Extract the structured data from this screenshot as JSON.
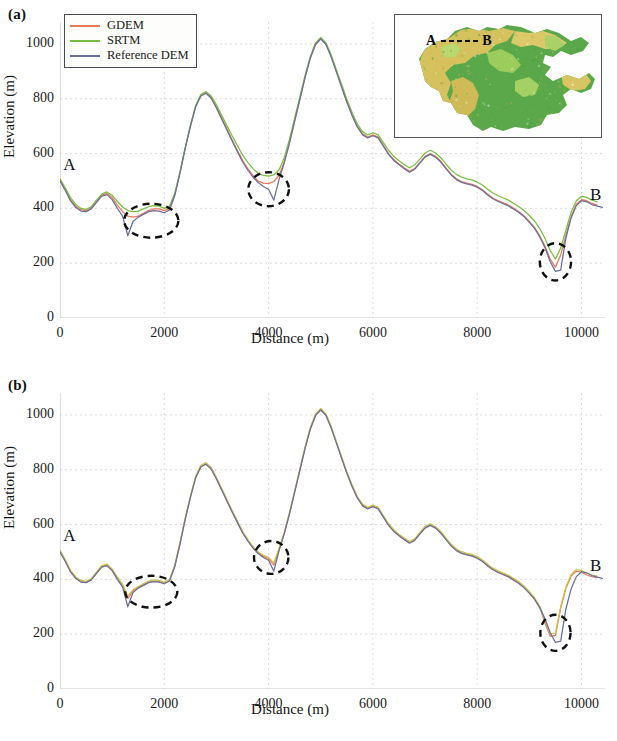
{
  "figure": {
    "panels": [
      {
        "id": "a",
        "label": "(a)",
        "legend": [
          {
            "name": "GDEM",
            "color": "#e8795a"
          },
          {
            "name": "SRTM",
            "color": "#79c040"
          },
          {
            "name": "Reference DEM",
            "color": "#6b6f9e"
          }
        ],
        "start_label": "A",
        "end_label": "B"
      },
      {
        "id": "b",
        "label": "(b)",
        "legend": [
          {
            "name": "GDEM after shifting",
            "color": "#e8795a"
          },
          {
            "name": "SRTM after re-interpolation",
            "color": "#79c040"
          },
          {
            "name": "Reference DEM",
            "color": "#6b6f9e"
          }
        ],
        "start_label": "A",
        "end_label": "B"
      }
    ],
    "inset": {
      "transect_start_label": "A",
      "transect_end_label": "B",
      "description": "shaded-relief terrain map with A-B transect line"
    }
  },
  "chart_data": [
    {
      "type": "line",
      "panel": "a",
      "title": "",
      "xlabel": "Distance (m)",
      "ylabel": "Elevation (m)",
      "xlim": [
        0,
        10450
      ],
      "ylim": [
        0,
        1080
      ],
      "xticks": [
        0,
        2000,
        4000,
        6000,
        8000,
        10000
      ],
      "xtick_labels": [
        "0",
        "2000",
        "4000",
        "6000",
        "8000",
        "10000"
      ],
      "yticks": [
        0,
        200,
        400,
        600,
        800,
        1000
      ],
      "ytick_labels": [
        "0",
        "200",
        "400",
        "600",
        "800",
        "1000"
      ],
      "grid": true,
      "legend_position": "upper-left",
      "annotations": [
        {
          "type": "ellipse",
          "cx": 1750,
          "cy": 355,
          "rx": 520,
          "ry": 62,
          "style": "dashed",
          "color": "#111111"
        },
        {
          "type": "ellipse",
          "cx": 4000,
          "cy": 470,
          "rx": 390,
          "ry": 62,
          "style": "dashed",
          "color": "#111111"
        },
        {
          "type": "ellipse",
          "cx": 9500,
          "cy": 205,
          "rx": 300,
          "ry": 68,
          "style": "dashed",
          "color": "#111111"
        },
        {
          "type": "text",
          "text": "A",
          "x": 60,
          "y": 540
        },
        {
          "type": "text",
          "text": "B",
          "x": 10380,
          "y": 430
        }
      ],
      "x": [
        0,
        100,
        200,
        300,
        400,
        500,
        600,
        700,
        800,
        900,
        1000,
        1100,
        1200,
        1300,
        1400,
        1500,
        1600,
        1700,
        1800,
        1900,
        2000,
        2100,
        2200,
        2300,
        2400,
        2500,
        2600,
        2700,
        2800,
        2900,
        3000,
        3100,
        3200,
        3300,
        3400,
        3500,
        3600,
        3700,
        3800,
        3900,
        4000,
        4100,
        4200,
        4300,
        4400,
        4500,
        4600,
        4700,
        4800,
        4900,
        5000,
        5100,
        5200,
        5300,
        5400,
        5500,
        5600,
        5700,
        5800,
        5900,
        6000,
        6100,
        6200,
        6300,
        6400,
        6500,
        6600,
        6700,
        6800,
        6900,
        7000,
        7100,
        7200,
        7300,
        7400,
        7500,
        7600,
        7700,
        7800,
        7900,
        8000,
        8100,
        8200,
        8300,
        8400,
        8500,
        8600,
        8700,
        8800,
        8900,
        9000,
        9100,
        9200,
        9300,
        9400,
        9500,
        9600,
        9700,
        9800,
        9900,
        10000,
        10100,
        10200,
        10300,
        10400
      ],
      "series": [
        {
          "name": "GDEM",
          "color": "#e8795a",
          "values": [
            505,
            470,
            432,
            408,
            395,
            392,
            402,
            425,
            448,
            455,
            440,
            412,
            388,
            372,
            368,
            372,
            382,
            392,
            398,
            398,
            392,
            400,
            450,
            530,
            620,
            700,
            772,
            812,
            822,
            805,
            770,
            730,
            690,
            650,
            612,
            575,
            545,
            520,
            500,
            492,
            490,
            498,
            520,
            570,
            640,
            720,
            800,
            880,
            950,
            1000,
            1020,
            1000,
            955,
            900,
            845,
            790,
            742,
            700,
            672,
            660,
            668,
            660,
            630,
            600,
            578,
            562,
            548,
            535,
            545,
            568,
            590,
            600,
            590,
            572,
            548,
            525,
            508,
            498,
            492,
            488,
            480,
            468,
            452,
            438,
            428,
            420,
            412,
            400,
            388,
            372,
            352,
            330,
            300,
            262,
            215,
            185,
            230,
            300,
            370,
            415,
            432,
            428,
            418,
            412
          ]
        },
        {
          "name": "SRTM",
          "color": "#79c040",
          "values": [
            508,
            475,
            440,
            415,
            400,
            396,
            406,
            430,
            452,
            460,
            448,
            425,
            405,
            392,
            388,
            390,
            398,
            406,
            410,
            408,
            400,
            408,
            455,
            532,
            622,
            702,
            775,
            815,
            826,
            810,
            778,
            740,
            702,
            665,
            630,
            595,
            568,
            545,
            528,
            520,
            518,
            522,
            540,
            585,
            652,
            730,
            808,
            886,
            954,
            1004,
            1024,
            1004,
            960,
            906,
            852,
            798,
            750,
            708,
            680,
            668,
            676,
            668,
            640,
            612,
            590,
            574,
            560,
            548,
            558,
            580,
            602,
            612,
            602,
            585,
            562,
            540,
            524,
            514,
            508,
            504,
            496,
            485,
            470,
            456,
            446,
            438,
            430,
            418,
            406,
            392,
            374,
            354,
            326,
            290,
            246,
            215,
            255,
            320,
            386,
            428,
            444,
            440,
            430,
            424
          ]
        },
        {
          "name": "Reference DEM",
          "color": "#6b6f9e",
          "values": [
            500,
            466,
            428,
            404,
            390,
            388,
            398,
            422,
            445,
            450,
            432,
            400,
            372,
            300,
            352,
            368,
            378,
            388,
            392,
            390,
            384,
            394,
            446,
            528,
            618,
            698,
            770,
            810,
            820,
            802,
            766,
            726,
            686,
            646,
            608,
            570,
            540,
            514,
            494,
            480,
            470,
            430,
            505,
            566,
            638,
            718,
            798,
            878,
            948,
            998,
            1018,
            998,
            952,
            897,
            842,
            787,
            739,
            697,
            669,
            657,
            665,
            657,
            627,
            597,
            575,
            559,
            545,
            532,
            542,
            565,
            587,
            597,
            587,
            569,
            545,
            522,
            505,
            495,
            489,
            485,
            477,
            465,
            449,
            435,
            425,
            417,
            409,
            397,
            385,
            369,
            349,
            327,
            296,
            256,
            205,
            170,
            175,
            292,
            365,
            410,
            428,
            424,
            414,
            408,
            404
          ]
        }
      ]
    },
    {
      "type": "line",
      "panel": "b",
      "title": "",
      "xlabel": "Distance (m)",
      "ylabel": "Elevation (m)",
      "xlim": [
        0,
        10450
      ],
      "ylim": [
        0,
        1080
      ],
      "xticks": [
        0,
        2000,
        4000,
        6000,
        8000,
        10000
      ],
      "xtick_labels": [
        "0",
        "2000",
        "4000",
        "6000",
        "8000",
        "10000"
      ],
      "yticks": [
        0,
        200,
        400,
        600,
        800,
        1000
      ],
      "ytick_labels": [
        "0",
        "200",
        "400",
        "600",
        "800",
        "1000"
      ],
      "grid": true,
      "legend_position": "upper-left",
      "annotations": [
        {
          "type": "ellipse",
          "cx": 1750,
          "cy": 355,
          "rx": 500,
          "ry": 58,
          "style": "dashed",
          "color": "#111111"
        },
        {
          "type": "ellipse",
          "cx": 4050,
          "cy": 480,
          "rx": 330,
          "ry": 60,
          "style": "dashed",
          "color": "#111111"
        },
        {
          "type": "ellipse",
          "cx": 9500,
          "cy": 205,
          "rx": 290,
          "ry": 66,
          "style": "dashed",
          "color": "#111111"
        },
        {
          "type": "text",
          "text": "A",
          "x": 60,
          "y": 540
        },
        {
          "type": "text",
          "text": "B",
          "x": 10380,
          "y": 430
        }
      ],
      "x": [
        0,
        100,
        200,
        300,
        400,
        500,
        600,
        700,
        800,
        900,
        1000,
        1100,
        1200,
        1300,
        1400,
        1500,
        1600,
        1700,
        1800,
        1900,
        2000,
        2100,
        2200,
        2300,
        2400,
        2500,
        2600,
        2700,
        2800,
        2900,
        3000,
        3100,
        3200,
        3300,
        3400,
        3500,
        3600,
        3700,
        3800,
        3900,
        4000,
        4100,
        4200,
        4300,
        4400,
        4500,
        4600,
        4700,
        4800,
        4900,
        5000,
        5100,
        5200,
        5300,
        5400,
        5500,
        5600,
        5700,
        5800,
        5900,
        6000,
        6100,
        6200,
        6300,
        6400,
        6500,
        6600,
        6700,
        6800,
        6900,
        7000,
        7100,
        7200,
        7300,
        7400,
        7500,
        7600,
        7700,
        7800,
        7900,
        8000,
        8100,
        8200,
        8300,
        8400,
        8500,
        8600,
        8700,
        8800,
        8900,
        9000,
        9100,
        9200,
        9300,
        9400,
        9500,
        9600,
        9700,
        9800,
        9900,
        10000,
        10100,
        10200,
        10300,
        10400
      ],
      "series": [
        {
          "name": "GDEM after shifting",
          "color": "#e8795a",
          "values": [
            502,
            468,
            430,
            406,
            392,
            389,
            399,
            423,
            446,
            452,
            434,
            404,
            378,
            330,
            358,
            370,
            380,
            390,
            394,
            392,
            386,
            396,
            448,
            530,
            620,
            700,
            772,
            812,
            822,
            804,
            768,
            728,
            688,
            648,
            610,
            572,
            542,
            516,
            496,
            484,
            476,
            452,
            508,
            568,
            640,
            720,
            800,
            880,
            950,
            1000,
            1020,
            1000,
            954,
            899,
            844,
            789,
            741,
            699,
            671,
            659,
            667,
            659,
            629,
            599,
            577,
            561,
            547,
            534,
            544,
            567,
            589,
            599,
            589,
            571,
            547,
            524,
            507,
            497,
            491,
            487,
            479,
            467,
            451,
            437,
            427,
            419,
            411,
            399,
            387,
            371,
            351,
            329,
            298,
            240,
            192,
            196,
            294,
            367,
            412,
            430,
            426,
            416,
            410,
            406
          ]
        },
        {
          "name": "SRTM after re-interpolation",
          "color": "#c9c24a",
          "values": [
            506,
            472,
            434,
            410,
            396,
            393,
            403,
            427,
            450,
            456,
            438,
            408,
            382,
            340,
            362,
            374,
            384,
            394,
            398,
            396,
            390,
            400,
            452,
            534,
            624,
            704,
            776,
            816,
            826,
            808,
            772,
            732,
            692,
            652,
            614,
            576,
            546,
            520,
            500,
            488,
            480,
            460,
            514,
            572,
            644,
            724,
            804,
            884,
            954,
            1004,
            1024,
            1004,
            958,
            903,
            848,
            793,
            745,
            703,
            675,
            663,
            671,
            663,
            633,
            603,
            581,
            565,
            551,
            538,
            548,
            571,
            593,
            603,
            593,
            575,
            551,
            528,
            511,
            501,
            495,
            491,
            483,
            471,
            455,
            441,
            431,
            423,
            415,
            403,
            391,
            375,
            355,
            333,
            302,
            250,
            202,
            204,
            300,
            372,
            418,
            436,
            432,
            422,
            416,
            412
          ]
        },
        {
          "name": "Reference DEM",
          "color": "#6b6f9e",
          "values": [
            500,
            466,
            428,
            404,
            390,
            388,
            398,
            422,
            445,
            450,
            432,
            400,
            372,
            300,
            352,
            368,
            378,
            388,
            392,
            390,
            384,
            394,
            446,
            528,
            618,
            698,
            770,
            810,
            820,
            802,
            766,
            726,
            686,
            646,
            608,
            570,
            540,
            514,
            494,
            480,
            470,
            430,
            505,
            566,
            638,
            718,
            798,
            878,
            948,
            998,
            1018,
            998,
            952,
            897,
            842,
            787,
            739,
            697,
            669,
            657,
            665,
            657,
            627,
            597,
            575,
            559,
            545,
            532,
            542,
            565,
            587,
            597,
            587,
            569,
            545,
            522,
            505,
            495,
            489,
            485,
            477,
            465,
            449,
            435,
            425,
            417,
            409,
            397,
            385,
            369,
            349,
            327,
            296,
            256,
            205,
            170,
            175,
            292,
            365,
            410,
            428,
            424,
            414,
            408,
            404
          ]
        }
      ]
    }
  ]
}
